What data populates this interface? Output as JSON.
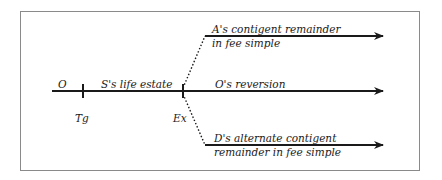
{
  "diagram": {
    "type": "timeline-branching",
    "colors": {
      "line": "#1a1a1a",
      "border": "#8a8a8a"
    },
    "main_line": {
      "start_label": "O",
      "segment_label": "S's life estate",
      "ticks": [
        {
          "label": "Tg"
        },
        {
          "label": "Ex"
        }
      ]
    },
    "branches": [
      {
        "line1": "A's contigent remainder",
        "line2": "in fee simple",
        "connector": "dotted"
      },
      {
        "line1": "O's reversion",
        "connector": "solid"
      },
      {
        "line1": "D's alternate contigent",
        "line2": "remainder in fee simple",
        "connector": "dotted"
      }
    ]
  }
}
